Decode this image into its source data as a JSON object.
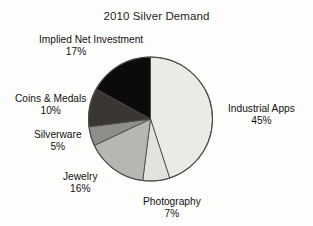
{
  "chart_data": {
    "type": "pie",
    "title": "2010 Silver Demand",
    "xlabel": "",
    "ylabel": "",
    "legend_position": "none",
    "grid": false,
    "start_angle_deg": 0,
    "direction": "clockwise",
    "categories": [
      "Industrial Apps",
      "Photography",
      "Jewelry",
      "Silverware",
      "Coins & Medals",
      "Implied Net Investment"
    ],
    "values": [
      45,
      7,
      16,
      5,
      10,
      17
    ],
    "value_unit": "%",
    "slices": [
      {
        "label": "Industrial Apps",
        "value": 45,
        "value_text": "45%",
        "color": "#eceae5"
      },
      {
        "label": "Photography",
        "value": 7,
        "value_text": "7%",
        "color": "#e3e2de"
      },
      {
        "label": "Jewelry",
        "value": 16,
        "value_text": "16%",
        "color": "#b6b6b2"
      },
      {
        "label": "Silverware",
        "value": 5,
        "value_text": "5%",
        "color": "#8d8d8a"
      },
      {
        "label": "Coins & Medals",
        "value": 10,
        "value_text": "10%",
        "color": "#3b3533"
      },
      {
        "label": "Implied Net Investment",
        "value": 17,
        "value_text": "17%",
        "color": "#0d0b0a"
      }
    ],
    "colors": {
      "outline": "#4a4a48",
      "background": "#fdfdfc",
      "text": "#121212"
    }
  }
}
